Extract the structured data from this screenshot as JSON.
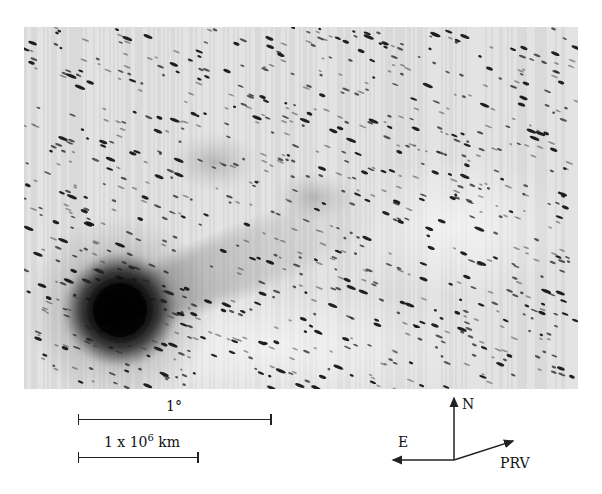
{
  "figure": {
    "plate": {
      "x": 24,
      "y": 27,
      "width": 554,
      "height": 362
    },
    "background_color": "#e2e2e2",
    "star_color": "#151515",
    "comet": {
      "head": {
        "cx": 96,
        "cy": 283,
        "r": 40
      },
      "tail_direction": "up-right",
      "diffuse_patch": {
        "cx": 190,
        "cy": 135
      }
    },
    "star_trail_angle_deg": 22,
    "star_count": 900
  },
  "scale_bars": {
    "angular": {
      "label": "1°",
      "x1": 78,
      "x2": 271,
      "y": 419
    },
    "linear": {
      "label_base": "1 x 10",
      "label_exp": "6",
      "label_unit": " km",
      "x1": 78,
      "x2": 198,
      "y": 457
    }
  },
  "compass": {
    "origin": {
      "x": 454,
      "y": 460
    },
    "north_label": "N",
    "east_label": "E",
    "prv_label": "PRV"
  }
}
